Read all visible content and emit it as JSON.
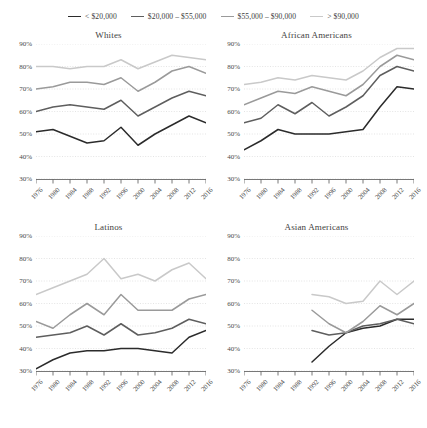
{
  "legend": {
    "position": "top-center",
    "items": [
      {
        "label": "< $20,000",
        "color": "#2b2b2b",
        "key": "lt20k"
      },
      {
        "label": "$20,000 – $55,000",
        "color": "#5e5e5e",
        "key": "20k55k"
      },
      {
        "label": "$55,000 – $90,000",
        "color": "#9a9a9a",
        "key": "55k90k"
      },
      {
        "label": "> $90,000",
        "color": "#c9c9c9",
        "key": "gt90k"
      }
    ]
  },
  "axis": {
    "y_ticks": [
      "30%",
      "40%",
      "50%",
      "60%",
      "70%",
      "80%",
      "90%"
    ],
    "x_ticks": [
      "1976",
      "1980",
      "1984",
      "1988",
      "1992",
      "1996",
      "2000",
      "2004",
      "2008",
      "2012",
      "2016"
    ]
  },
  "chart_data": {
    "type": "line",
    "title": "",
    "xlabel": "",
    "ylabel": "",
    "xlim": [
      1976,
      2016
    ],
    "ylim": [
      30,
      90
    ],
    "ytick_values": [
      30,
      40,
      50,
      60,
      70,
      80,
      90
    ],
    "x": [
      1976,
      1980,
      1984,
      1988,
      1992,
      1996,
      2000,
      2004,
      2008,
      2012,
      2016
    ],
    "grid": true,
    "legend_position": "top-center",
    "panels": [
      {
        "title": "Whites",
        "series": [
          {
            "name": "< $20,000",
            "color": "#2b2b2b",
            "x": [
              1976,
              1980,
              1984,
              1988,
              1992,
              1996,
              2000,
              2004,
              2008,
              2012,
              2016
            ],
            "values": [
              51,
              52,
              49,
              46,
              47,
              53,
              45,
              50,
              54,
              58,
              55,
              56
            ]
          },
          {
            "name": "$20,000 – $55,000",
            "color": "#5e5e5e",
            "x": [
              1976,
              1980,
              1984,
              1988,
              1992,
              1996,
              2000,
              2004,
              2008,
              2012,
              2016
            ],
            "values": [
              60,
              62,
              63,
              62,
              61,
              65,
              58,
              62,
              66,
              69,
              67,
              69
            ]
          },
          {
            "name": "$55,000 – $90,000",
            "color": "#9a9a9a",
            "x": [
              1976,
              1980,
              1984,
              1988,
              1992,
              1996,
              2000,
              2004,
              2008,
              2012,
              2016
            ],
            "values": [
              70,
              71,
              73,
              73,
              72,
              75,
              69,
              73,
              78,
              80,
              77,
              79
            ]
          },
          {
            "name": "> $90,000",
            "color": "#c9c9c9",
            "x": [
              1976,
              1980,
              1984,
              1988,
              1992,
              1996,
              2000,
              2004,
              2008,
              2012,
              2016
            ],
            "values": [
              80,
              80,
              79,
              80,
              80,
              83,
              79,
              82,
              85,
              84,
              83,
              84
            ]
          }
        ]
      },
      {
        "title": "African Americans",
        "series": [
          {
            "name": "< $20,000",
            "color": "#2b2b2b",
            "x": [
              1976,
              1980,
              1984,
              1988,
              1992,
              1996,
              2000,
              2004,
              2008,
              2012,
              2016
            ],
            "values": [
              43,
              47,
              52,
              50,
              50,
              50,
              51,
              52,
              62,
              71,
              70,
              59
            ]
          },
          {
            "name": "$20,000 – $55,000",
            "color": "#5e5e5e",
            "x": [
              1976,
              1980,
              1984,
              1988,
              1992,
              1996,
              2000,
              2004,
              2008,
              2012,
              2016
            ],
            "values": [
              55,
              57,
              63,
              59,
              64,
              58,
              62,
              67,
              76,
              80,
              78,
              72
            ]
          },
          {
            "name": "$55,000 – $90,000",
            "color": "#9a9a9a",
            "x": [
              1976,
              1980,
              1984,
              1988,
              1992,
              1996,
              2000,
              2004,
              2008,
              2012,
              2016
            ],
            "values": [
              63,
              66,
              69,
              68,
              71,
              69,
              67,
              72,
              80,
              85,
              83,
              79
            ]
          },
          {
            "name": "> $90,000",
            "color": "#c9c9c9",
            "x": [
              1976,
              1980,
              1984,
              1988,
              1992,
              1996,
              2000,
              2004,
              2008,
              2012,
              2016
            ],
            "values": [
              72,
              73,
              75,
              74,
              76,
              75,
              74,
              78,
              84,
              88,
              88,
              85
            ]
          }
        ]
      },
      {
        "title": "Latinos",
        "series": [
          {
            "name": "< $20,000",
            "color": "#2b2b2b",
            "x": [
              1976,
              1980,
              1984,
              1988,
              1992,
              1996,
              2000,
              2004,
              2008,
              2012,
              2016
            ],
            "values": [
              31,
              35,
              38,
              39,
              39,
              40,
              40,
              39,
              38,
              45,
              48,
              50
            ]
          },
          {
            "name": "$20,000 – $55,000",
            "color": "#5e5e5e",
            "x": [
              1976,
              1980,
              1984,
              1988,
              1992,
              1996,
              2000,
              2004,
              2008,
              2012,
              2016
            ],
            "values": [
              45,
              46,
              47,
              50,
              46,
              51,
              46,
              47,
              49,
              53,
              51,
              50
            ]
          },
          {
            "name": "$55,000 – $90,000",
            "color": "#9a9a9a",
            "x": [
              1976,
              1980,
              1984,
              1988,
              1992,
              1996,
              2000,
              2004,
              2008,
              2012,
              2016
            ],
            "values": [
              52,
              49,
              55,
              60,
              55,
              64,
              57,
              57,
              57,
              62,
              64,
              59,
              61
            ]
          },
          {
            "name": "> $90,000",
            "color": "#c9c9c9",
            "x": [
              1976,
              1980,
              1984,
              1988,
              1992,
              1996,
              2000,
              2004,
              2008,
              2012,
              2016
            ],
            "values": [
              64,
              67,
              70,
              73,
              80,
              71,
              73,
              70,
              75,
              78,
              71,
              70,
              75
            ]
          }
        ]
      },
      {
        "title": "Asian Americans",
        "series": [
          {
            "name": "< $20,000",
            "color": "#2b2b2b",
            "x": [
              1992,
              1996,
              2000,
              2004,
              2008,
              2012,
              2016
            ],
            "values": [
              34,
              41,
              47,
              49,
              50,
              53,
              53
            ]
          },
          {
            "name": "$20,000 – $55,000",
            "color": "#5e5e5e",
            "x": [
              1992,
              1996,
              2000,
              2004,
              2008,
              2012,
              2016
            ],
            "values": [
              48,
              46,
              47,
              50,
              51,
              53,
              51
            ]
          },
          {
            "name": "$55,000 – $90,000",
            "color": "#9a9a9a",
            "x": [
              1992,
              1996,
              2000,
              2004,
              2008,
              2012,
              2016
            ],
            "values": [
              57,
              51,
              47,
              52,
              59,
              55,
              60
            ]
          },
          {
            "name": "> $90,000",
            "color": "#c9c9c9",
            "x": [
              1992,
              1996,
              2000,
              2004,
              2008,
              2012,
              2016
            ],
            "values": [
              64,
              63,
              60,
              61,
              70,
              64,
              70
            ]
          }
        ]
      }
    ]
  }
}
